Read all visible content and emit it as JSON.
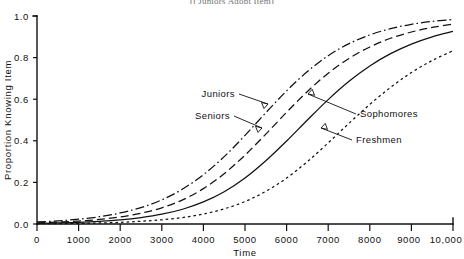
{
  "figure": {
    "caption_top": "(j Juniors Adopt Item)",
    "background": "#ffffff",
    "ink_color": "#111111"
  },
  "chart_data": {
    "type": "line",
    "title": "(j Juniors Adopt Item)",
    "xlabel": "Time",
    "ylabel": "Proportion Knowing Item",
    "xlim": [
      0,
      10000
    ],
    "ylim": [
      0.0,
      1.0
    ],
    "grid": false,
    "legend": "inline-annotations",
    "xticks": [
      0,
      1000,
      2000,
      3000,
      4000,
      5000,
      6000,
      7000,
      8000,
      9000,
      10000
    ],
    "xtick_labels": [
      "0",
      "1000",
      "2000",
      "3000",
      "4000",
      "5000",
      "6000",
      "7000",
      "8000",
      "9000",
      "10,000"
    ],
    "yticks": [
      0.0,
      0.2,
      0.4,
      0.6,
      0.8,
      1.0
    ],
    "ytick_labels": [
      "0.0",
      "0.2",
      "0.4",
      "0.6",
      "0.8",
      "1.0"
    ],
    "x": [
      0,
      500,
      1000,
      1500,
      2000,
      2500,
      3000,
      3500,
      4000,
      4500,
      5000,
      5500,
      6000,
      6500,
      7000,
      7500,
      8000,
      8500,
      9000,
      9500,
      10000
    ],
    "series": [
      {
        "name": "Juniors",
        "linestyle": "dashdot",
        "midpoint_x": 4800,
        "values": [
          0.01,
          0.015,
          0.023,
          0.035,
          0.053,
          0.079,
          0.116,
          0.168,
          0.237,
          0.324,
          0.426,
          0.535,
          0.64,
          0.733,
          0.809,
          0.867,
          0.909,
          0.939,
          0.96,
          0.974,
          0.983
        ]
      },
      {
        "name": "Seniors",
        "linestyle": "dashed",
        "midpoint_x": 5350,
        "values": [
          0.006,
          0.009,
          0.014,
          0.022,
          0.034,
          0.052,
          0.078,
          0.116,
          0.17,
          0.242,
          0.331,
          0.432,
          0.537,
          0.637,
          0.725,
          0.796,
          0.851,
          0.893,
          0.923,
          0.945,
          0.961
        ]
      },
      {
        "name": "Sophomores",
        "linestyle": "solid",
        "midpoint_x": 6000,
        "values": [
          0.003,
          0.005,
          0.008,
          0.013,
          0.02,
          0.031,
          0.047,
          0.071,
          0.106,
          0.155,
          0.221,
          0.304,
          0.399,
          0.5,
          0.598,
          0.686,
          0.76,
          0.819,
          0.865,
          0.9,
          0.926
        ]
      },
      {
        "name": "Freshmen",
        "linestyle": "dotted",
        "midpoint_x": 6900,
        "values": [
          0.001,
          0.002,
          0.003,
          0.005,
          0.008,
          0.013,
          0.02,
          0.031,
          0.048,
          0.073,
          0.108,
          0.157,
          0.221,
          0.3,
          0.39,
          0.484,
          0.575,
          0.657,
          0.728,
          0.786,
          0.833
        ]
      }
    ],
    "annotations": [
      {
        "text": "Juniors",
        "target_series": "Juniors"
      },
      {
        "text": "Seniors",
        "target_series": "Seniors"
      },
      {
        "text": "Sophomores",
        "target_series": "Sophomores"
      },
      {
        "text": "Freshmen",
        "target_series": "Freshmen"
      }
    ]
  }
}
